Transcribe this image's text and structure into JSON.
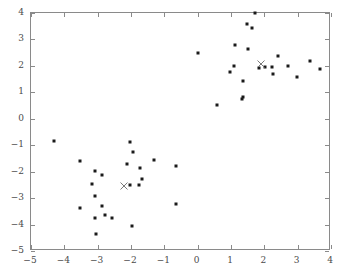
{
  "chart_data": {
    "type": "scatter",
    "title": "",
    "subtitle": "",
    "xlabel": "",
    "ylabel": "",
    "xlim": [
      -5,
      4
    ],
    "ylim": [
      -5,
      4
    ],
    "xticks": [
      -5,
      -4,
      -3,
      -2,
      -1,
      0,
      1,
      2,
      3,
      4
    ],
    "xtick_labels": [
      "−5",
      "−4",
      "−3",
      "−2",
      "−1",
      "0",
      "1",
      "2",
      "3",
      "4"
    ],
    "yticks": [
      -5,
      -4,
      -3,
      -2,
      -1,
      0,
      1,
      2,
      3,
      4
    ],
    "ytick_labels": [
      "−5",
      "−4",
      "−3",
      "−2",
      "−1",
      "0",
      "1",
      "2",
      "3",
      "4"
    ],
    "grid": false,
    "legend": null,
    "marker_color": "#1a1a1a",
    "centroid_color": "#7a7a7a",
    "frame_color": "#8a8a8a",
    "series": [
      {
        "name": "cluster-1",
        "marker": "square-dot",
        "points": [
          [
            -4.31,
            -0.84
          ],
          [
            -3.52,
            -1.58
          ],
          [
            -3.08,
            -1.96
          ],
          [
            -2.86,
            -2.13
          ],
          [
            -3.18,
            -2.48
          ],
          [
            -3.53,
            -3.39
          ],
          [
            -3.09,
            -2.92
          ],
          [
            -2.88,
            -3.29
          ],
          [
            -3.09,
            -3.77
          ],
          [
            -3.05,
            -4.37
          ],
          [
            -2.77,
            -3.62
          ],
          [
            -2.58,
            -3.74
          ],
          [
            -2.04,
            -0.86
          ],
          [
            -1.93,
            -1.24
          ],
          [
            -1.74,
            -1.85
          ],
          [
            -1.66,
            -2.28
          ],
          [
            -2.02,
            -2.52
          ],
          [
            -1.77,
            -2.5
          ],
          [
            -2.12,
            -1.72
          ],
          [
            -1.97,
            -4.05
          ],
          [
            -1.31,
            -1.55
          ],
          [
            -0.64,
            -1.79
          ],
          [
            -0.66,
            -3.21
          ]
        ]
      },
      {
        "name": "cluster-2",
        "marker": "square-dot",
        "points": [
          [
            0.02,
            2.5
          ],
          [
            0.58,
            0.53
          ],
          [
            0.96,
            1.78
          ],
          [
            1.1,
            2.0
          ],
          [
            1.11,
            2.79
          ],
          [
            1.33,
            0.75
          ],
          [
            1.35,
            0.84
          ],
          [
            1.37,
            1.44
          ],
          [
            1.47,
            3.6
          ],
          [
            1.5,
            2.64
          ],
          [
            1.64,
            3.43
          ],
          [
            1.73,
            4.0
          ],
          [
            1.85,
            1.93
          ],
          [
            2.01,
            1.94
          ],
          [
            2.24,
            1.94
          ],
          [
            2.41,
            2.38
          ],
          [
            2.26,
            1.7
          ],
          [
            2.7,
            2.0
          ],
          [
            2.99,
            1.57
          ],
          [
            3.38,
            2.18
          ],
          [
            3.68,
            1.88
          ]
        ]
      }
    ],
    "centroids": [
      {
        "name": "centroid-cluster-1",
        "marker": "x",
        "point": [
          -2.21,
          -2.55
        ]
      },
      {
        "name": "centroid-cluster-2",
        "marker": "x",
        "point": [
          1.9,
          2.08
        ]
      }
    ]
  }
}
